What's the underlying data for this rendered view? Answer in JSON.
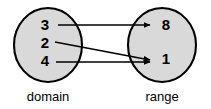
{
  "diagram": {
    "colors": {
      "set_fill": "#d9d9d9",
      "outline": "#000000",
      "background": "#ffffff",
      "arrow": "#000000"
    },
    "domain": {
      "caption": "domain",
      "elements": [
        {
          "label": "3"
        },
        {
          "label": "2"
        },
        {
          "label": "4"
        }
      ]
    },
    "range": {
      "caption": "range",
      "elements": [
        {
          "label": "8"
        },
        {
          "label": "1"
        }
      ]
    },
    "mappings": [
      {
        "from": "3",
        "to": "8"
      },
      {
        "from": "2",
        "to": "1"
      },
      {
        "from": "4",
        "to": "1"
      }
    ]
  }
}
